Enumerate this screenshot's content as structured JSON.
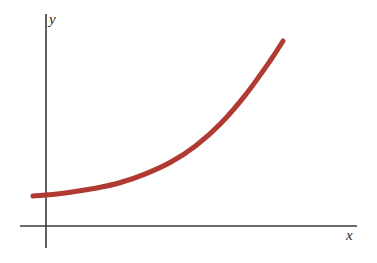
{
  "figure": {
    "background_color": "#ffffff",
    "axis_color": "#3a3a3a",
    "curve_color": "#b03a32"
  },
  "labels": {
    "y_axis": "y",
    "x_axis": "x"
  },
  "chart_data": {
    "type": "line",
    "title": "",
    "xlabel": "x",
    "ylabel": "y",
    "grid": false,
    "legend": "none",
    "xlim": [
      0,
      10
    ],
    "ylim": [
      0,
      10
    ],
    "series": [
      {
        "name": "exponential-curve",
        "color": "#b03a32",
        "line_width_px": 5,
        "x": [
          -0.5,
          0,
          1,
          2,
          3,
          4,
          5,
          6,
          7,
          8,
          9,
          9.5
        ],
        "y": [
          1.25,
          1.3,
          1.45,
          1.65,
          1.95,
          2.4,
          3.0,
          3.85,
          5.0,
          6.5,
          8.3,
          9.3
        ]
      }
    ],
    "pixel_path": {
      "start": [
        33,
        196
      ],
      "end": [
        283,
        41
      ],
      "control_points": [
        [
          33,
          196
        ],
        [
          120,
          186
        ],
        [
          200,
          139
        ],
        [
          283,
          41
        ]
      ]
    },
    "axes_pixels": {
      "y_axis": {
        "x": 46,
        "y_top": 14,
        "y_bottom": 248
      },
      "x_axis": {
        "y": 226,
        "x_left": 20,
        "x_right": 357
      }
    }
  }
}
